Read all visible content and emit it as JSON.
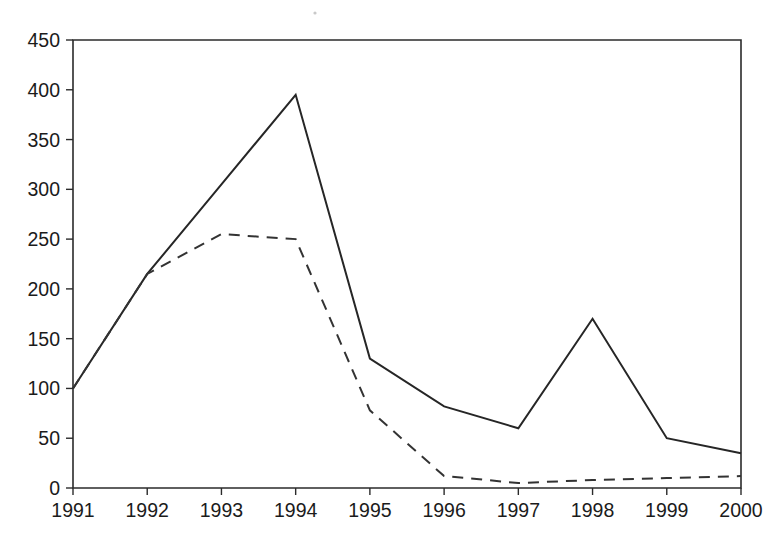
{
  "chart_data": {
    "type": "line",
    "title": "",
    "subtitle": "",
    "xlabel": "",
    "ylabel": "",
    "categories": [
      "1991",
      "1992",
      "1993",
      "1994",
      "1995",
      "1996",
      "1997",
      "1998",
      "1999",
      "2000"
    ],
    "x": [
      1991,
      1992,
      1993,
      1994,
      1995,
      1996,
      1997,
      1998,
      1999,
      2000
    ],
    "series": [
      {
        "name": "solid-series",
        "style": "solid",
        "color": "#262626",
        "values": [
          100,
          215,
          305,
          395,
          130,
          82,
          60,
          170,
          50,
          35
        ]
      },
      {
        "name": "dashed-series",
        "style": "dashed",
        "color": "#333333",
        "values": [
          100,
          215,
          255,
          250,
          78,
          12,
          5,
          8,
          10,
          12
        ]
      }
    ],
    "xlim": [
      1991,
      2000
    ],
    "ylim": [
      0,
      450
    ],
    "ytick_values": [
      0,
      50,
      100,
      150,
      200,
      250,
      300,
      350,
      400,
      450
    ],
    "ytick_labels": [
      "0",
      "50",
      "100",
      "150",
      "200",
      "250",
      "300",
      "350",
      "400",
      "450"
    ],
    "xtick_labels": [
      "1991",
      "1992",
      "1993",
      "1994",
      "1995",
      "1996",
      "1997",
      "1998",
      "1999",
      "2000"
    ],
    "grid": false,
    "legend": "none",
    "legend_position": "none",
    "annotations": []
  },
  "plot_geometry": {
    "left": 73,
    "right": 741,
    "top": 40,
    "bottom": 488
  }
}
